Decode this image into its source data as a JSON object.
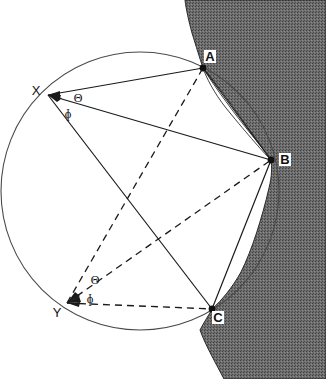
{
  "figure": {
    "background_color": "#ffffff",
    "line_color": "#1a1a1a",
    "land_fill": "#6e6e6e",
    "label_box_fill": "#ffffff"
  },
  "points": [
    {
      "id": "A",
      "label": "A",
      "x": 203,
      "y": 68,
      "style": "charted-object",
      "label_boxed": true
    },
    {
      "id": "B",
      "label": "B",
      "x": 271,
      "y": 160,
      "style": "charted-object",
      "label_boxed": true
    },
    {
      "id": "C",
      "label": "C",
      "x": 212,
      "y": 309,
      "style": "charted-object",
      "label_boxed": true
    },
    {
      "id": "X",
      "label": "X",
      "x": 48,
      "y": 95,
      "style": "observer",
      "label_boxed": false
    },
    {
      "id": "Y",
      "label": "Y",
      "x": 67,
      "y": 303,
      "style": "observer",
      "label_boxed": false
    }
  ],
  "circle": {
    "label": "position circle",
    "center_x": 140,
    "center_y": 191,
    "radius": 139,
    "stroke": "#4a4a4a",
    "style": "solid"
  },
  "angles": [
    {
      "symbol": "Θ",
      "name": "theta",
      "at_point": "X",
      "x": 78,
      "y": 98
    },
    {
      "symbol": "ɸ",
      "name": "phi",
      "at_point": "X",
      "x": 68,
      "y": 114
    },
    {
      "symbol": "Θ",
      "name": "theta",
      "at_point": "Y",
      "x": 95,
      "y": 280
    },
    {
      "symbol": "ɸ",
      "name": "phi",
      "at_point": "Y",
      "x": 90,
      "y": 299
    }
  ],
  "rays": {
    "from_X": {
      "style": "solid",
      "targets": [
        "A",
        "B",
        "C"
      ]
    },
    "from_Y": {
      "style": "dashed",
      "targets": [
        "A",
        "B",
        "C"
      ]
    }
  },
  "coastline": {
    "name": "shaded-coastline",
    "fill": "#6e6e6e",
    "texture": "stipple"
  }
}
